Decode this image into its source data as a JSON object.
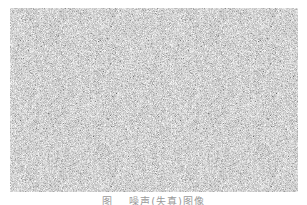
{
  "figure": {
    "content": "grayscale random noise image",
    "base_color": "#a6a6a6"
  },
  "caption": {
    "label": "图",
    "number": "",
    "text": "噪声(失真)图像"
  }
}
